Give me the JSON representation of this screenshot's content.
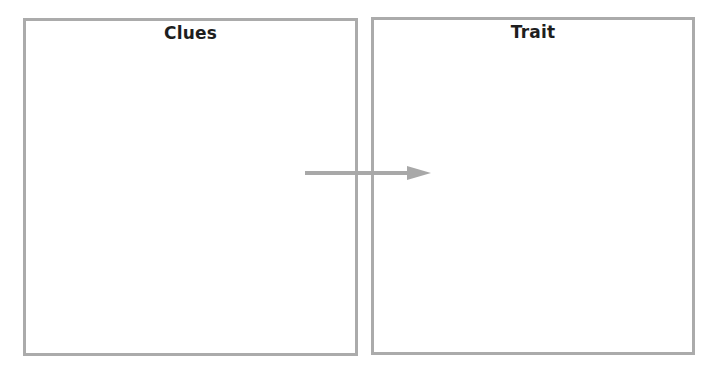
{
  "diagram": {
    "boxes": [
      {
        "title": "Clues"
      },
      {
        "title": "Trait"
      }
    ],
    "arrow": {
      "from": "Clues",
      "to": "Trait",
      "color": "#a8a8a8"
    },
    "border_color": "#ababab"
  }
}
